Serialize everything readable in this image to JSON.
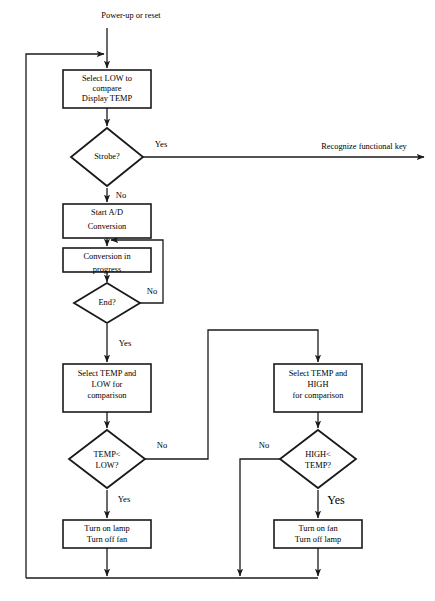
{
  "diagram": {
    "title": "Power-up or reset",
    "type": "flowchart",
    "background_color": "#ffffff",
    "line_color": "#1a1a1a",
    "text_color": "#000000"
  },
  "nodes": {
    "entry_label": "Power-up or reset",
    "select_low": {
      "shape": "process",
      "lines": [
        "Select LOW to",
        "compare",
        "Display TEMP"
      ]
    },
    "strobe": {
      "shape": "decision",
      "lines": [
        "Strobe?"
      ]
    },
    "recognize_key": "Recognize functional key",
    "start_ad": {
      "shape": "process",
      "lines": [
        "Start A/D",
        "Conversion"
      ]
    },
    "conversion_progress": {
      "shape": "process",
      "lines": [
        "Conversion in",
        "progress"
      ]
    },
    "end_check": {
      "shape": "decision",
      "lines": [
        "End?"
      ]
    },
    "select_temp_low": {
      "shape": "process",
      "lines": [
        "Select TEMP and",
        "LOW for",
        "comparison"
      ]
    },
    "select_temp_high": {
      "shape": "process",
      "lines": [
        "Select TEMP and",
        "HIGH",
        "for comparison"
      ]
    },
    "temp_lt_low": {
      "shape": "decision",
      "lines": [
        "TEMP<",
        "LOW?"
      ]
    },
    "high_lt_temp": {
      "shape": "decision",
      "lines": [
        "HIGH<",
        "TEMP?"
      ]
    },
    "lamp_on": {
      "shape": "process",
      "lines": [
        "Turn on lamp",
        "Turn off fan"
      ]
    },
    "fan_on": {
      "shape": "process",
      "lines": [
        "Turn on fan",
        "Turn off lamp"
      ]
    }
  },
  "edge_labels": {
    "strobe_yes": "Yes",
    "strobe_no": "No",
    "end_no": "No",
    "end_yes": "Yes",
    "temp_lt_low_no": "No",
    "temp_lt_low_yes": "Yes",
    "high_lt_temp_no": "No",
    "high_lt_temp_yes": "Yes"
  }
}
